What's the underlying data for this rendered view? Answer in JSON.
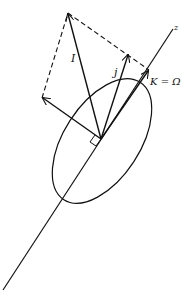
{
  "diagram": {
    "title": "",
    "labels": {
      "I": "I",
      "j": "j",
      "K_eq_Omega": "K = Ω",
      "z": "z"
    },
    "colors": {
      "stroke": "#111111",
      "background": "#ffffff"
    },
    "elements": [
      "z-axis line",
      "ellipse (tilted orbit/cone cross-section)",
      "vector I",
      "vector j",
      "vector K = Ω along z-axis",
      "perpendicular vector to left",
      "dashed parallelogram completing I",
      "right-angle marker at origin"
    ]
  }
}
